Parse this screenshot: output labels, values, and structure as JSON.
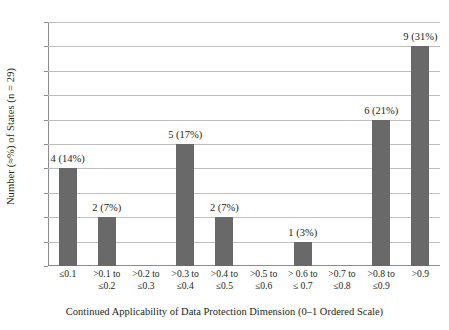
{
  "chart_data": {
    "type": "bar",
    "title": "",
    "xlabel": "Continued Applicability of Data Protection Dimension (0–1 Ordered Scale)",
    "ylabel": "Number (≈%) of States (n = 29)",
    "ylim": [
      0,
      10
    ],
    "grid": true,
    "legend": null,
    "categories": [
      "≤0.1",
      ">0.1 to ≤0.2",
      ">0.2 to ≤0.3",
      ">0.3 to ≤0.4",
      ">0.4 to ≤0.5",
      ">0.5 to ≤0.6",
      "> 0.6 to ≤ 0.7",
      ">0.7 to ≤0.8",
      ">0.8 to ≤0.9",
      ">0.9"
    ],
    "category_lines": [
      {
        "line1": "≤0.1",
        "line2": ""
      },
      {
        "line1": ">0.1 to",
        "line2": "≤0.2"
      },
      {
        "line1": ">0.2 to",
        "line2": "≤0.3"
      },
      {
        "line1": ">0.3 to",
        "line2": "≤0.4"
      },
      {
        "line1": ">0.4 to",
        "line2": "≤0.5"
      },
      {
        "line1": ">0.5 to",
        "line2": "≤0.6"
      },
      {
        "line1": "> 0.6 to",
        "line2": "≤ 0.7"
      },
      {
        "line1": ">0.7 to",
        "line2": "≤0.8"
      },
      {
        "line1": ">0.8 to",
        "line2": "≤0.9"
      },
      {
        "line1": ">0.9",
        "line2": ""
      }
    ],
    "values": [
      4,
      2,
      0,
      5,
      2,
      0,
      1,
      0,
      6,
      9
    ],
    "percentages": [
      14,
      7,
      0,
      17,
      7,
      0,
      3,
      0,
      21,
      31
    ],
    "data_labels": [
      "4 (14%)",
      "2 (7%)",
      "",
      "5 (17%)",
      "2 (7%)",
      "",
      "1 (3%)",
      "",
      "6 (21%)",
      "9 (31%)"
    ],
    "ytick_labels": [
      "0",
      "1",
      "2",
      "3",
      "4",
      "5",
      "6",
      "7",
      "8",
      "9",
      "10"
    ],
    "yticks": [
      0,
      1,
      2,
      3,
      4,
      5,
      6,
      7,
      8,
      9,
      10
    ],
    "colors": {
      "bar": "#696969",
      "gridline": "#bfbfbf",
      "axis": "#8c8c8c",
      "text": "#231f20",
      "background": "#ffffff"
    }
  }
}
